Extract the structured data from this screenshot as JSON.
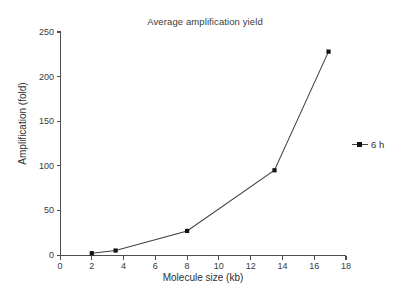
{
  "chart_data": {
    "type": "line",
    "title": "Average amplification yield",
    "xlabel": "Molecule size (kb)",
    "ylabel": "Amplification (fold)",
    "xlim": [
      0,
      18
    ],
    "ylim": [
      0,
      250
    ],
    "xticks": [
      "0",
      "2",
      "4",
      "6",
      "8",
      "10",
      "12",
      "14",
      "16",
      "18"
    ],
    "xtick_values": [
      0,
      2,
      4,
      6,
      8,
      10,
      12,
      14,
      16,
      18
    ],
    "yticks": [
      "0",
      "50",
      "100",
      "150",
      "200",
      "250"
    ],
    "ytick_values": [
      0,
      50,
      100,
      150,
      200,
      250
    ],
    "grid": false,
    "legend_position": "right",
    "series": [
      {
        "name": "6 h",
        "color": "#3f3f3f",
        "marker": "square",
        "x": [
          2.0,
          3.5,
          8.0,
          13.5,
          16.9
        ],
        "values": [
          2,
          5,
          27,
          95,
          228
        ]
      }
    ]
  },
  "legend": {
    "entries": [
      {
        "label": "6 h"
      }
    ]
  }
}
